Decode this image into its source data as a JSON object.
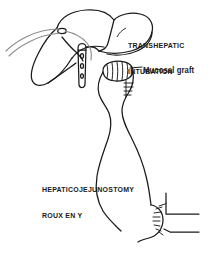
{
  "figure": {
    "type": "medical-line-drawing",
    "background_color": "#ffffff",
    "ink_color": "#1a1a1a",
    "catheter_color": "#8c8c8c",
    "width": 219,
    "height": 258
  },
  "labels": {
    "transhepatic": {
      "line1": "TRANSHEPATIC",
      "line2": "INTUBATION"
    },
    "mucosal_graft": "Mucosal graft",
    "hepaticojejunostomy": {
      "line1": "HEPATICOJEJUNOSTOMY",
      "line2": "ROUX EN Y"
    }
  },
  "structures": {
    "liver": "liver-outline",
    "liver_lobe_right": "right-lobe",
    "liver_lobe_left": "left-lobe",
    "transhepatic_catheter": "catheter-tube",
    "biliary_stent": "stent-with-side-holes",
    "mucosal_graft_cap": "hatched-graft",
    "roux_limb": "jejunal-limb",
    "jejunojejunostomy": "distal-anastomosis",
    "suture_line_graft": "graft-sutures",
    "suture_line_anastomosis": "anastomosis-sutures"
  }
}
